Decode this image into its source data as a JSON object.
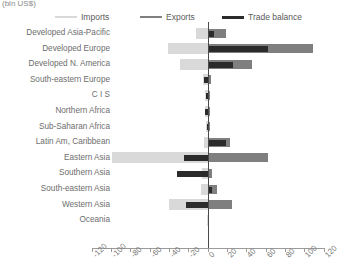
{
  "unit_label": "(bln US$)",
  "legend": [
    {
      "name": "imports",
      "label": "Imports",
      "color": "#d9d9d9"
    },
    {
      "name": "exports",
      "label": "Exports",
      "color": "#7f7f7f"
    },
    {
      "name": "balance",
      "label": "Trade balance",
      "color": "#2b2b2b"
    }
  ],
  "chart_data": {
    "type": "bar",
    "orientation": "horizontal",
    "title": "",
    "subtitle": "",
    "xlabel": "(bln US$)",
    "ylabel": "",
    "xlim": [
      -120,
      120
    ],
    "xticks": [
      -120,
      -100,
      -80,
      -60,
      -40,
      -20,
      0,
      20,
      40,
      60,
      80,
      100,
      120
    ],
    "xtick_labels": [
      "-120",
      "-100",
      "-80",
      "-60",
      "-40",
      "-20",
      "0",
      "20",
      "40",
      "60",
      "80",
      "100",
      "120"
    ],
    "grid": false,
    "legend_position": "top",
    "categories": [
      "Developed Asia-Pacific",
      "Developed Europe",
      "Developed N. America",
      "South-eastern Europe",
      "C I S",
      "Northern Africa",
      "Sub-Saharan Africa",
      "Latin Am, Caribbean",
      "Eastern Asia",
      "Southern Asia",
      "South-eastern Asia",
      "Western Asia",
      "Oceania"
    ],
    "series": [
      {
        "name": "Imports",
        "color": "#d9d9d9",
        "values": [
          -12,
          -41,
          -29,
          -5,
          -3,
          -3,
          -2,
          -4,
          -99,
          -6,
          -7,
          -40,
          -1
        ]
      },
      {
        "name": "Exports",
        "color": "#7f7f7f",
        "values": [
          19,
          109,
          46,
          3,
          2,
          2,
          2,
          23,
          62,
          4,
          10,
          25,
          1
        ]
      },
      {
        "name": "Trade balance",
        "color": "#2b2b2b",
        "values": [
          7,
          62,
          26,
          -4,
          -2,
          -3,
          -1,
          19,
          -25,
          -32,
          4,
          -22,
          0
        ]
      }
    ]
  }
}
